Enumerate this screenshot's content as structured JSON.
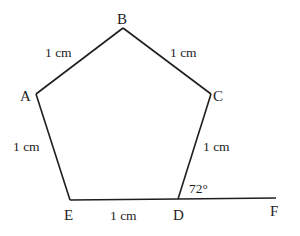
{
  "diagram": {
    "title": "",
    "shape": "regular pentagon with extended side",
    "stroke_color": "#1e1e1e",
    "background": "#ffffff",
    "vertices": [
      {
        "name": "A",
        "x": 36,
        "y": 94
      },
      {
        "name": "B",
        "x": 123,
        "y": 28
      },
      {
        "name": "C",
        "x": 211,
        "y": 94
      },
      {
        "name": "D",
        "x": 178,
        "y": 199
      },
      {
        "name": "E",
        "x": 70,
        "y": 200
      },
      {
        "name": "F",
        "x": 276,
        "y": 198
      }
    ],
    "labels": {
      "A": "A",
      "B": "B",
      "C": "C",
      "D": "D",
      "E": "E",
      "F": "F"
    },
    "side_lengths": {
      "AB": "1 cm",
      "BC": "1 cm",
      "CD": "1 cm",
      "DE": "1 cm",
      "EA": "1 cm"
    },
    "angle": {
      "label": "72°",
      "at": "D",
      "between": "CD and DF"
    },
    "extension": {
      "segment": "DF",
      "description": "side ED extended beyond D to F"
    }
  }
}
